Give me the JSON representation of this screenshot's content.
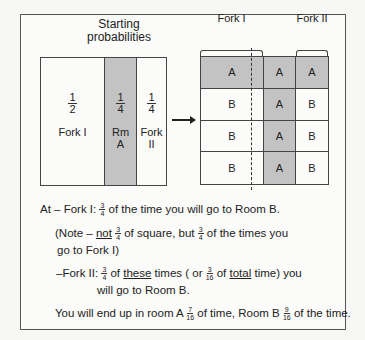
{
  "diagram": {
    "starting_title_line1": "Starting",
    "starting_title_line2": "probabilities",
    "left_columns": [
      {
        "num": "1",
        "den": "2",
        "label1": "Fork I",
        "label2": "",
        "shaded": false
      },
      {
        "num": "1",
        "den": "4",
        "label1": "Rm",
        "label2": "A",
        "shaded": true
      },
      {
        "num": "1",
        "den": "4",
        "label1": "Fork",
        "label2": "II",
        "shaded": false
      }
    ],
    "right_headers": {
      "fork1": "Fork I",
      "fork2": "Fork II"
    },
    "grid": [
      [
        "A",
        "A",
        "A"
      ],
      [
        "B",
        "A",
        "B"
      ],
      [
        "B",
        "A",
        "B"
      ],
      [
        "B",
        "A",
        "B"
      ]
    ],
    "colors": {
      "shade": "#c3c3c3",
      "line": "#444444"
    }
  },
  "explanation": {
    "line1_pre": "At – Fork I: ",
    "line1_num": "3",
    "line1_den": "4",
    "line1_post": " of the time you will go to Room B.",
    "note_pre": "(Note – ",
    "note_not": "not",
    "note_num1": "3",
    "note_den1": "4",
    "note_mid": " of square, but ",
    "note_num2": "3",
    "note_den2": "4",
    "note_post": " of the times you",
    "note_line2": "go to Fork I)",
    "fork2_pre": "–Fork II: ",
    "fork2_num1": "3",
    "fork2_den1": "4",
    "fork2_of": " of ",
    "fork2_these": "these",
    "fork2_mid": " times ( or ",
    "fork2_num2": "3",
    "fork2_den2": "16",
    "fork2_of2": " of ",
    "fork2_total": "total",
    "fork2_post": " time) you",
    "fork2_line2": "will go to Room B.",
    "end_pre": "You will end up in room A ",
    "end_num1": "7",
    "end_den1": "16",
    "end_mid": " of time, Room B ",
    "end_num2": "9",
    "end_den2": "16",
    "end_post": " of the time."
  }
}
